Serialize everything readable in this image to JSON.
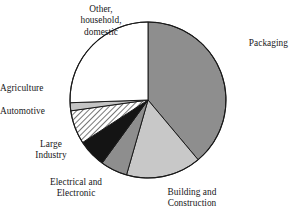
{
  "chart_data": {
    "type": "pie",
    "title": "",
    "subtitle": "",
    "xlabel": "",
    "ylabel": "",
    "legend_position": "labels-around-pie",
    "grid": false,
    "start_angle_deg": 0,
    "direction": "clockwise",
    "center": {
      "x": 148,
      "y": 100
    },
    "radius": 78,
    "categories": [
      "Packaging",
      "Building and\nConstruction",
      "Electrical and\nElectronic",
      "Large\nIndustry",
      "Automotive",
      "Agriculture",
      "Other,\nhousehold,\ndomestic"
    ],
    "values": [
      39,
      16,
      5.5,
      6,
      7,
      1.5,
      25
    ],
    "slices": [
      {
        "label": "Packaging",
        "value": 39,
        "start_deg": 0,
        "end_deg": 140,
        "fill": "#8e8e8e",
        "pattern": "solid",
        "label_pos": {
          "x": 228,
          "y": 42
        },
        "label_align": "left"
      },
      {
        "label": "Building and\nConstruction",
        "value": 16,
        "start_deg": 140,
        "end_deg": 196,
        "fill": "#c8c8c8",
        "pattern": "solid",
        "label_pos": {
          "x": 152,
          "y": 192
        },
        "label_align": "center"
      },
      {
        "label": "Electrical and\nElectronic",
        "value": 5.5,
        "start_deg": 196,
        "end_deg": 216,
        "fill": "#8e8e8e",
        "pattern": "solid",
        "label_pos": {
          "x": 76,
          "y": 182
        },
        "label_align": "center"
      },
      {
        "label": "Large\nIndustry",
        "value": 6,
        "start_deg": 216,
        "end_deg": 237,
        "fill": "#141414",
        "pattern": "solid",
        "label_pos": {
          "x": 52,
          "y": 144
        },
        "label_align": "center"
      },
      {
        "label": "Automotive",
        "value": 7,
        "start_deg": 237,
        "end_deg": 262,
        "fill": "#ffffff",
        "pattern": "diagonal-hatch",
        "label_pos": {
          "x": 63,
          "y": 110
        },
        "label_align": "right"
      },
      {
        "label": "Agriculture",
        "value": 1.5,
        "start_deg": 262,
        "end_deg": 268,
        "fill": "#c4c4c4",
        "pattern": "solid",
        "label_pos": {
          "x": 63,
          "y": 87
        },
        "label_align": "right"
      },
      {
        "label": "Other,\nhousehold,\ndomestic",
        "value": 25,
        "start_deg": 268,
        "end_deg": 360,
        "fill": "#ffffff",
        "pattern": "solid",
        "label_pos": {
          "x": 101,
          "y": 5
        },
        "label_align": "center"
      }
    ],
    "colors": {
      "outline": "#1a1a1a",
      "packaging": "#8e8e8e",
      "building_construction": "#c8c8c8",
      "electrical_electronic": "#8e8e8e",
      "large_industry": "#141414",
      "automotive_hatch_bg": "#ffffff",
      "agriculture": "#c4c4c4",
      "other_household_domestic": "#ffffff",
      "background": "#ffffff",
      "text": "#17171a"
    }
  }
}
